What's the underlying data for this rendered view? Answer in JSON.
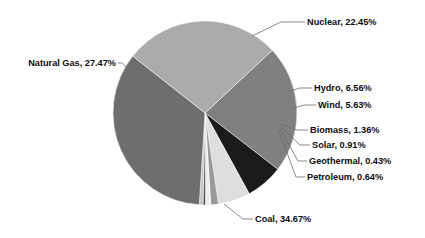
{
  "chart_data": {
    "type": "pie",
    "title": "",
    "subtitle": "",
    "legend_position": "callout-labels",
    "grid": false,
    "label_format": "{name}, {value}%",
    "categories": [
      "Nuclear",
      "Hydro",
      "Wind",
      "Biomass",
      "Solar",
      "Geothermal",
      "Petroleum",
      "Coal",
      "Natural Gas"
    ],
    "values": [
      22.45,
      6.56,
      5.63,
      1.36,
      0.91,
      0.43,
      0.64,
      34.67,
      27.47
    ],
    "total": 100.12,
    "start_angle_deg": -43,
    "direction": "clockwise",
    "slices": [
      {
        "name": "Nuclear",
        "value": 22.45,
        "label": "Nuclear, 22.45%",
        "color": "#808080"
      },
      {
        "name": "Hydro",
        "value": 6.56,
        "label": "Hydro, 6.56%",
        "color": "#1a1a1a"
      },
      {
        "name": "Wind",
        "value": 5.63,
        "label": "Wind, 5.63%",
        "color": "#dedede"
      },
      {
        "name": "Biomass",
        "value": 1.36,
        "label": "Biomass, 1.36%",
        "color": "#9a9a9a"
      },
      {
        "name": "Solar",
        "value": 0.91,
        "label": "Solar, 0.91%",
        "color": "#efefef"
      },
      {
        "name": "Geothermal",
        "value": 0.43,
        "label": "Geothermal, 0.43%",
        "color": "#4d4d4d"
      },
      {
        "name": "Petroleum",
        "value": 0.64,
        "label": "Petroleum, 0.64%",
        "color": "#c6c6c6"
      },
      {
        "name": "Coal",
        "value": 34.67,
        "label": "Coal, 34.67%",
        "color": "#6e6e6e"
      },
      {
        "name": "Natural Gas",
        "value": 27.47,
        "label": "Natural Gas, 27.47%",
        "color": "#ababab"
      }
    ],
    "colors": {
      "background": "#ffffff",
      "label_text": "#0d0d0d",
      "leader_line": "#6b6b6b"
    },
    "geometry": {
      "center_x": 205,
      "center_y": 113,
      "radius": 92
    }
  },
  "labels": {
    "nuclear": "Nuclear, 22.45%",
    "natural_gas": "Natural Gas, 27.47%",
    "hydro": "Hydro, 6.56%",
    "wind": "Wind, 5.63%",
    "biomass": "Biomass, 1.36%",
    "solar": "Solar, 0.91%",
    "geothermal": "Geothermal, 0.43%",
    "petroleum": "Petroleum, 0.64%",
    "coal": "Coal, 34.67%"
  }
}
